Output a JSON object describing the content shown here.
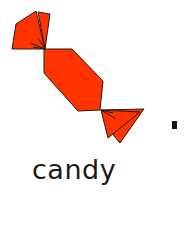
{
  "label": "candy",
  "colors": {
    "candy_fill": "#ff3300",
    "outline": "#2a1a10",
    "dot": "#111111",
    "background": "#ffffff"
  },
  "icon": "candy-icon"
}
